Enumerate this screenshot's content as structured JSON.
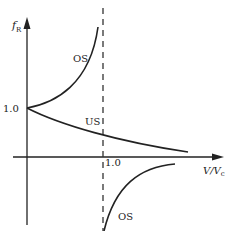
{
  "diagram": {
    "y_axis_label": "f",
    "y_axis_subscript": "R",
    "x_axis_label": "V/V",
    "x_axis_subscript": "c",
    "y_tick_label": "1.0",
    "x_tick_label": "1.0",
    "curves": [
      {
        "name": "OS",
        "label": "OS",
        "description": "oversteer branch rising toward asymptote at V/Vc = 1.0"
      },
      {
        "name": "US",
        "label": "US",
        "description": "understeer branch decreasing from 1.0"
      },
      {
        "name": "OS-lower",
        "label": "OS",
        "description": "oversteer branch below axis beyond V/Vc = 1.0"
      }
    ],
    "asymptote": "dashed vertical line at V/Vc = 1.0",
    "colors": {
      "line": "#222222",
      "background": "#ffffff"
    }
  }
}
